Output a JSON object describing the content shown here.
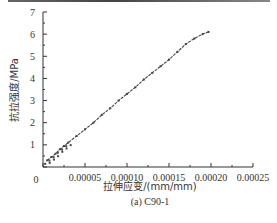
{
  "chart_data": {
    "type": "line",
    "title": "",
    "caption": "(a)  C90-1",
    "xlabel": "拉伸应变/(mm/mm)",
    "ylabel": "抗拉强度/MPa",
    "xlim": [
      0,
      0.00025
    ],
    "ylim": [
      0,
      7
    ],
    "xticks": [
      "0",
      "0.00005",
      "0.00010",
      "0.00015",
      "0.00020",
      "0.00025"
    ],
    "xtick_values": [
      0,
      5e-05,
      0.0001,
      0.00015,
      0.0002,
      0.00025
    ],
    "yticks": [
      "1",
      "2",
      "3",
      "4",
      "5",
      "6",
      "7"
    ],
    "ytick_values": [
      1,
      2,
      3,
      4,
      5,
      6,
      7
    ],
    "grid": false,
    "legend": null,
    "series": [
      {
        "name": "C90-1",
        "color": "#444444",
        "x": [
          5e-06,
          1e-05,
          1.5e-05,
          2e-05,
          2.5e-05,
          3e-05,
          4e-05,
          5e-05,
          6e-05,
          7e-05,
          8e-05,
          9e-05,
          0.0001,
          0.00011,
          0.00012,
          0.00013,
          0.00014,
          0.00015,
          0.00016,
          0.00017,
          0.00018,
          0.00019,
          0.000197
        ],
        "values": [
          0.3,
          0.45,
          0.6,
          0.8,
          0.95,
          1.1,
          1.4,
          1.7,
          2.0,
          2.35,
          2.65,
          3.0,
          3.3,
          3.6,
          3.95,
          4.25,
          4.55,
          4.85,
          5.2,
          5.55,
          5.8,
          6.0,
          6.1
        ]
      }
    ]
  },
  "plot": {
    "origin_label": "0"
  }
}
